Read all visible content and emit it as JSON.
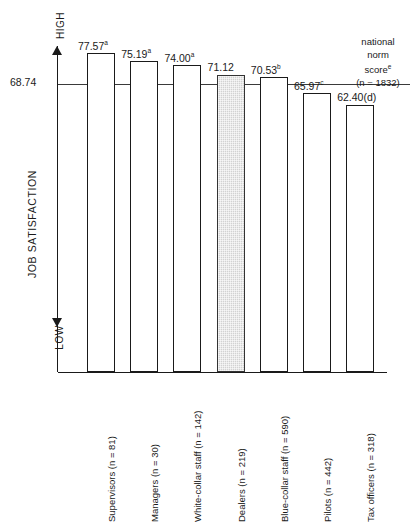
{
  "chart_data": {
    "type": "bar",
    "title": "",
    "xlabel": "",
    "ylabel": "JOB SATISFACTION",
    "axis_high_label": "HIGH",
    "axis_low_label": "LOW",
    "reference_line": {
      "value": "68.74",
      "numeric": 68.74,
      "label_lines": [
        "national",
        "norm",
        "score",
        "(n = 1832)"
      ],
      "label_superscript": "e",
      "n": 1832
    },
    "grid": false,
    "legend": "none",
    "categories": [
      "Supervisors (n = 81)",
      "Managers (n = 30)",
      "White-collar staff (n = 142)",
      "Dealers (n = 219)",
      "Blue-collar staff (n = 590)",
      "Pilots (n = 442)",
      "Tax officers (n = 318)"
    ],
    "values": [
      77.57,
      75.19,
      74.0,
      71.12,
      70.53,
      65.97,
      62.4
    ],
    "value_labels": [
      "77.57",
      "75.19",
      "74.00",
      "71.12",
      "70.53",
      "65.97",
      "62.40(d)"
    ],
    "value_superscripts": [
      "a",
      "a",
      "a",
      "",
      "b",
      "c",
      ""
    ],
    "group_sizes": [
      81,
      30,
      142,
      219,
      590,
      442,
      318
    ],
    "highlighted_index": 3,
    "highlight_color": "#d2d2d2",
    "bar_color": "#ffffff",
    "bar_border_color": "#1a1a1a"
  }
}
